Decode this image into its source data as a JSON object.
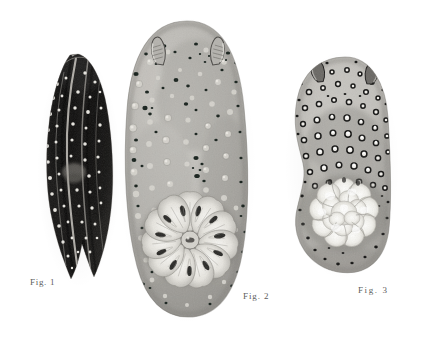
{
  "plate": {
    "background_color": "#ffffff",
    "medium": "halftone engraving plate",
    "subject": "three dorid nudibranch specimens, dorsal view",
    "caption_color": "#5d5d5d"
  },
  "figures": [
    {
      "id": "fig-1",
      "caption": "Fig. 1",
      "description": "elongate curved dark-bodied sea slug with pale spots and light longitudinal stripes",
      "tone": "dark",
      "body_color": "#1d1c1b",
      "spot_color": "#e9e7e2",
      "bounds": {
        "x": 40,
        "y": 54,
        "width": 75,
        "height": 228
      }
    },
    {
      "id": "fig-2",
      "caption": "Fig. 2",
      "description": "large broad oval nudibranch with tuberculate mantle, two rhinophores and a spreading branchial rosette",
      "tone": "light",
      "body_color": "#b9b7b2",
      "spot_color": "#1b1a19",
      "tubercle_color": "#dedcd6",
      "gill_color": "#efeee9",
      "bounds": {
        "x": 126,
        "y": 21,
        "width": 122,
        "height": 296
      }
    },
    {
      "id": "fig-3",
      "caption": "Fig. 3",
      "description": "oval nudibranch with dense dark-ringed white tubercles and a bright white ruffled branchial rosette",
      "tone": "medium",
      "body_color": "#bdbbb6",
      "spot_color": "#141413",
      "tubercle_color": "#f2f1ec",
      "gill_color": "#fbfaf7",
      "bounds": {
        "x": 291,
        "y": 57,
        "width": 101,
        "height": 218
      }
    }
  ]
}
